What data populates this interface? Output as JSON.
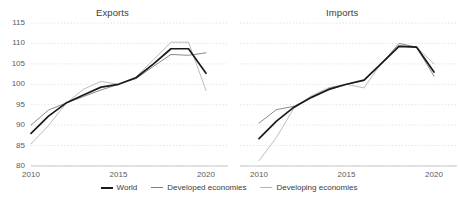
{
  "figure": {
    "background": "#ffffff",
    "panels": [
      {
        "id": "exports",
        "title": "Exports"
      },
      {
        "id": "imports",
        "title": "Imports"
      }
    ]
  },
  "legend": {
    "position": "bottom-center",
    "items": [
      {
        "label": "World",
        "color": "#1a1a1a"
      },
      {
        "label": "Developed economies",
        "color": "#7d7d7d"
      },
      {
        "label": "Developing economies",
        "color": "#b4b4b4"
      }
    ]
  },
  "axes": {
    "y_ticks": [
      "115",
      "110",
      "105",
      "100",
      "95",
      "90",
      "85",
      "80"
    ],
    "x_ticks_exports": [
      "2010",
      "2015",
      "2020"
    ],
    "x_ticks_imports": [
      "2010",
      "2015",
      "2020"
    ]
  },
  "chart_data": [
    {
      "type": "line",
      "title": "Exports",
      "xlabel": "",
      "ylabel": "",
      "ylim": [
        80,
        115
      ],
      "xlim": [
        2010,
        2020
      ],
      "grid": true,
      "gridlines_y": [
        80,
        85,
        90,
        95,
        100,
        105,
        110,
        115
      ],
      "legend_position": "bottom-center",
      "x": [
        2010,
        2011,
        2012,
        2013,
        2014,
        2015,
        2016,
        2017,
        2018,
        2019,
        2020
      ],
      "series": [
        {
          "name": "World",
          "color": "#1a1a1a",
          "values": [
            88.0,
            92.2,
            95.4,
            97.4,
            99.3,
            100.0,
            101.6,
            105.0,
            108.7,
            108.7,
            102.7
          ]
        },
        {
          "name": "Developed economies",
          "color": "#7d7d7d",
          "values": [
            90.0,
            93.7,
            95.4,
            97.0,
            98.6,
            100.0,
            101.4,
            104.4,
            107.3,
            107.1,
            107.7
          ]
        },
        {
          "name": "Developing economies",
          "color": "#b4b4b4",
          "values": [
            85.4,
            89.9,
            95.3,
            98.8,
            100.7,
            100.0,
            101.8,
            106.0,
            110.3,
            110.3,
            98.5
          ]
        }
      ]
    },
    {
      "type": "line",
      "title": "Imports",
      "xlabel": "",
      "ylabel": "",
      "ylim": [
        80,
        115
      ],
      "xlim": [
        2010,
        2020
      ],
      "grid": true,
      "gridlines_y": [
        80,
        85,
        90,
        95,
        100,
        105,
        110,
        115
      ],
      "legend_position": "bottom-center",
      "x": [
        2010,
        2011,
        2012,
        2013,
        2014,
        2015,
        2016,
        2017,
        2018,
        2019,
        2020
      ],
      "series": [
        {
          "name": "World",
          "color": "#1a1a1a",
          "values": [
            86.7,
            91.0,
            94.4,
            96.8,
            98.8,
            100.0,
            101.0,
            105.1,
            109.3,
            109.1,
            103.0
          ]
        },
        {
          "name": "Developed economies",
          "color": "#7d7d7d",
          "values": [
            90.5,
            93.8,
            94.6,
            96.8,
            98.6,
            100.0,
            100.9,
            105.0,
            110.0,
            109.1,
            102.0
          ]
        },
        {
          "name": "Developing economies",
          "color": "#b4b4b4",
          "values": [
            81.3,
            87.0,
            94.2,
            97.2,
            99.2,
            100.0,
            99.1,
            105.3,
            109.5,
            109.1,
            105.0
          ]
        }
      ]
    }
  ]
}
